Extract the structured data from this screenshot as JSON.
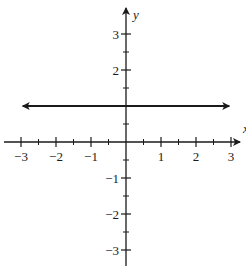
{
  "chart_data": {
    "type": "line",
    "title": "",
    "xlabel": "x",
    "ylabel": "y",
    "xlim": [
      -3.4,
      3.4
    ],
    "ylim": [
      -3.5,
      3.6
    ],
    "grid": false,
    "x_ticks_major": [
      -3,
      -2,
      -1,
      1,
      2,
      3
    ],
    "x_ticks_minor": [
      -2.5,
      -1.5,
      -0.5,
      0.5,
      1.5,
      2.5
    ],
    "y_ticks_major": [
      3,
      2,
      -1,
      -2,
      -3
    ],
    "y_ticks_minor": [
      2.5,
      1.5,
      0.5,
      -0.5,
      -1.5,
      -2.5
    ],
    "x_tick_labels": [
      "−3",
      "−2",
      "−1",
      "1",
      "2",
      "3"
    ],
    "y_tick_labels": [
      "3",
      "2",
      "−1",
      "−2",
      "−3"
    ],
    "series": [
      {
        "name": "horizontal line y = 1",
        "equation": "y = 1",
        "x": [
          -2.95,
          2.95
        ],
        "y": [
          1,
          1
        ],
        "arrows": "both",
        "color": "#1a1a1a"
      }
    ],
    "legend": null
  },
  "labels": {
    "x_axis": "x",
    "y_axis": "y"
  },
  "colors": {
    "ink": "#1a1a1a",
    "background": "#ffffff"
  }
}
